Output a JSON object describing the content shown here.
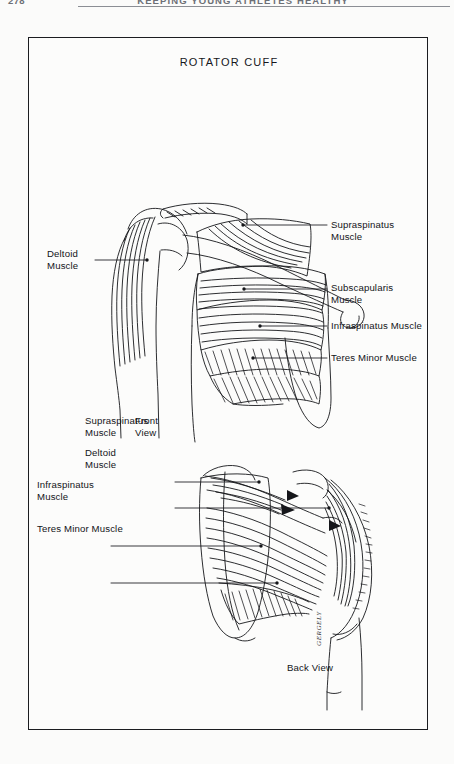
{
  "page": {
    "folio": "278",
    "running_title": "KEEPING YOUNG ATHLETES HEALTHY",
    "background_color": "#fbfbfa",
    "ink_color": "#15161a"
  },
  "figure": {
    "title": "ROTATOR CUFF",
    "border_color": "#1b1c20",
    "signature": "GERGELY",
    "views": [
      {
        "key": "front",
        "label": "Front\nView"
      },
      {
        "key": "back",
        "label": "Back View"
      }
    ],
    "anterior_labels": [
      {
        "key": "supraspinatus",
        "text": "Supraspinatus Muscle",
        "side": "right"
      },
      {
        "key": "subscapularis",
        "text": "Subscapularis\nMuscle",
        "side": "right"
      },
      {
        "key": "infraspinatus",
        "text": "Infraspinatus Muscle",
        "side": "right"
      },
      {
        "key": "teres-minor",
        "text": "Teres Minor Muscle",
        "side": "right"
      },
      {
        "key": "deltoid",
        "text": "Deltoid\nMuscle",
        "side": "left"
      }
    ],
    "posterior_labels": [
      {
        "key": "supraspinatus",
        "text": "Supraspinatus\nMuscle",
        "side": "left"
      },
      {
        "key": "deltoid",
        "text": "Deltoid\nMuscle",
        "side": "left"
      },
      {
        "key": "infraspinatus",
        "text": "Infraspinatus\nMuscle",
        "side": "left"
      },
      {
        "key": "teres-minor",
        "text": "Teres Minor Muscle",
        "side": "left"
      }
    ]
  }
}
